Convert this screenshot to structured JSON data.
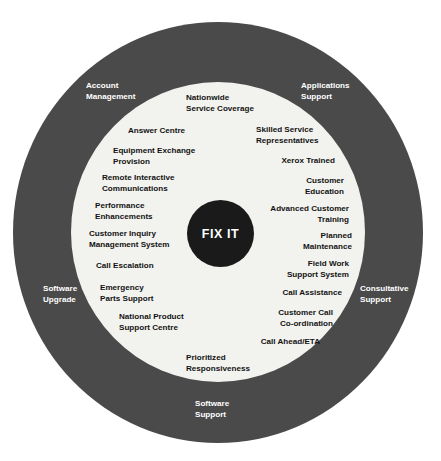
{
  "diagram": {
    "core": {
      "label": "FIX IT",
      "color": "#1a1a1a",
      "text_color": "#ffffff"
    },
    "outer_ring": {
      "color": "#4a4a4a",
      "text_color": "#ffffff",
      "items": [
        {
          "label": "Account\nManagement",
          "position": "top-left"
        },
        {
          "label": "Applications\nSupport",
          "position": "top-right"
        },
        {
          "label": "Software\nUpgrade",
          "position": "left"
        },
        {
          "label": "Consultative\nSupport",
          "position": "right"
        },
        {
          "label": "Software\nSupport",
          "position": "bottom"
        }
      ]
    },
    "inner_disc": {
      "color": "#f2f2ef",
      "text_color": "#121212",
      "items": [
        {
          "label": "Nationwide\nService Coverage",
          "column": "top"
        },
        {
          "label": "Answer Centre",
          "column": "left"
        },
        {
          "label": "Equipment Exchange\nProvision",
          "column": "left"
        },
        {
          "label": "Remote Interactive\nCommunications",
          "column": "left"
        },
        {
          "label": "Performance\nEnhancements",
          "column": "left"
        },
        {
          "label": "Customer Inquiry\nManagement System",
          "column": "left"
        },
        {
          "label": "Call Escalation",
          "column": "left"
        },
        {
          "label": "Emergency\nParts Support",
          "column": "left"
        },
        {
          "label": "National Product\nSupport Centre",
          "column": "left"
        },
        {
          "label": "Skilled Service\nRepresentatives",
          "column": "right"
        },
        {
          "label": "Xerox Trained",
          "column": "right"
        },
        {
          "label": "Customer\nEducation",
          "column": "right"
        },
        {
          "label": "Advanced Customer\nTraining",
          "column": "right"
        },
        {
          "label": "Planned\nMaintenance",
          "column": "right"
        },
        {
          "label": "Field Work\nSupport System",
          "column": "right"
        },
        {
          "label": "Call Assistance",
          "column": "right"
        },
        {
          "label": "Customer Call\nCo-ordination",
          "column": "right"
        },
        {
          "label": "Call Ahead/ETA",
          "column": "right"
        },
        {
          "label": "Prioritized\nResponsiveness",
          "column": "bottom"
        }
      ]
    }
  }
}
